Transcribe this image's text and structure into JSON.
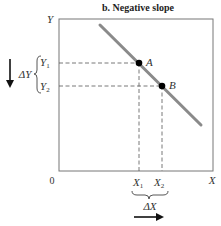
{
  "diagram": {
    "title": "b. Negative slope",
    "axes": {
      "y_label": "Y",
      "x_label": "X",
      "origin_label": "0"
    },
    "points": [
      {
        "label": "A",
        "x_label": "X",
        "x_sub": "1",
        "y_label": "Y",
        "y_sub": "1"
      },
      {
        "label": "B",
        "x_label": "X",
        "x_sub": "2",
        "y_label": "Y",
        "y_sub": "2"
      }
    ],
    "delta_y": {
      "label": "ΔY",
      "direction": "down"
    },
    "delta_x": {
      "label": "ΔX",
      "direction": "right"
    },
    "colors": {
      "line": "#8a8a8a",
      "axes": "#666666",
      "points": "#000000",
      "dashes": "#555555"
    }
  }
}
